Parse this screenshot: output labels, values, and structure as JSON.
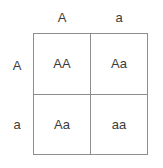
{
  "diagram": {
    "type": "punnett-square",
    "colors": {
      "grid_line": "#8d8d8d",
      "text": "#3a3a3a",
      "background": "#ffffff"
    },
    "column_headers": [
      {
        "label": "A"
      },
      {
        "label": "a"
      }
    ],
    "row_headers": [
      {
        "label": "A"
      },
      {
        "label": "a"
      }
    ],
    "cells": [
      {
        "label": "AA",
        "row": 0,
        "col": 0
      },
      {
        "label": "Aa",
        "row": 0,
        "col": 1
      },
      {
        "label": "Aa",
        "row": 1,
        "col": 0
      },
      {
        "label": "aa",
        "row": 1,
        "col": 1
      }
    ]
  }
}
